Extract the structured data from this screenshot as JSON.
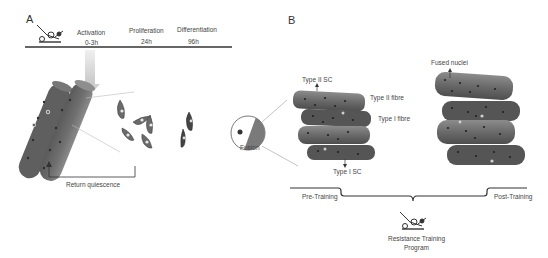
{
  "panel_a": {
    "letter": "A",
    "timeline": [
      {
        "stage": "Activation",
        "time": "0-3h"
      },
      {
        "stage": "Proliferation",
        "time": "24h"
      },
      {
        "stage": "Differentiation",
        "time": "96h"
      }
    ],
    "return_label": "Return quiescence",
    "icon": "resistance-training-machine-icon"
  },
  "panel_b": {
    "letter": "B",
    "labels": {
      "type2_sc": "Type II SC",
      "type2_fibre": "Type II fibre",
      "type1_fibre": "Type I fibre",
      "type1_sc": "Type I SC",
      "fusion": "Fusion",
      "fused_nuclei": "Fused nuclei"
    },
    "pre": "Pre-Training",
    "post": "Post-Training",
    "program_line1": "Resistance Training",
    "program_line2": "Program",
    "icon": "resistance-training-machine-icon"
  },
  "colors": {
    "fibre_dark": "#5a5a5a",
    "fibre_light": "#8a8a8a",
    "nucleus": "#2a2a2a",
    "line": "#333333",
    "arrow_light": "#d8d8d8"
  }
}
